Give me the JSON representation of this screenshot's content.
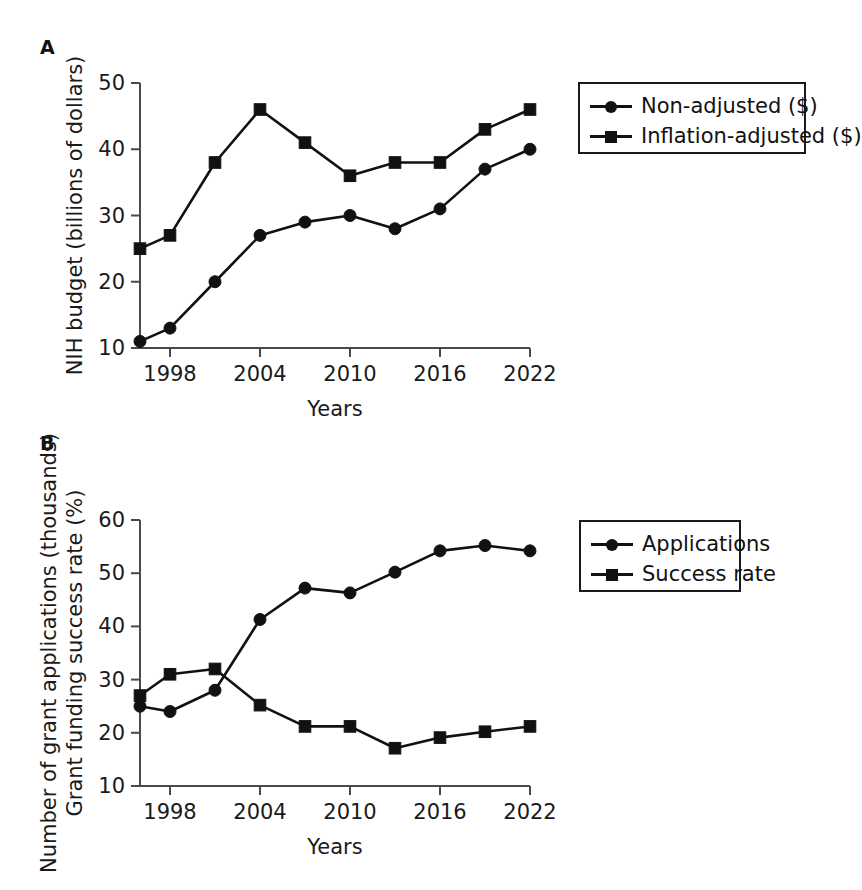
{
  "figure": {
    "panels": [
      {
        "id": "a",
        "label": "A",
        "legend": {
          "items": [
            {
              "marker": "circle",
              "label": "Non-adjusted ($)"
            },
            {
              "marker": "square",
              "label": "Inflation-adjusted ($)"
            }
          ]
        }
      },
      {
        "id": "b",
        "label": "B",
        "legend": {
          "items": [
            {
              "marker": "circle",
              "label": "Applications"
            },
            {
              "marker": "square",
              "label": "Success rate"
            }
          ]
        }
      }
    ]
  },
  "chart_data": [
    {
      "type": "line",
      "panel": "A",
      "title": "",
      "xlabel": "Years",
      "ylabel": "NIH budget (billions of dollars)",
      "ylabel_lines": [
        "NIH budget (billions of dollars)"
      ],
      "x": [
        1996,
        1998,
        2000,
        2002,
        2004,
        2006,
        2008,
        2010,
        2012,
        2014,
        2016,
        2018,
        2020,
        2022
      ],
      "xticks": [
        1998,
        2004,
        2010,
        2016,
        2022
      ],
      "xticklabels": [
        "1998",
        "2004",
        "2010",
        "2016",
        "2022"
      ],
      "yticks": [
        10,
        20,
        30,
        40,
        50
      ],
      "yticklabels": [
        "10",
        "20",
        "30",
        "40",
        "50"
      ],
      "xlim": [
        1996,
        2022
      ],
      "ylim": [
        10,
        50
      ],
      "grid": false,
      "legend_position": "right-outside",
      "series": [
        {
          "name": "Non-adjusted ($)",
          "marker": "circle",
          "color": "#111111",
          "values": [
            11,
            13,
            20,
            27,
            29,
            30,
            28,
            31,
            37,
            40
          ],
          "x": [
            1996,
            1998,
            2002,
            2006,
            2008,
            2010,
            2012,
            2016,
            2018,
            2022
          ],
          "points": [
            {
              "year": 1996,
              "value": 11
            },
            {
              "year": 1998,
              "value": 13
            },
            {
              "year": 2001,
              "value": 20
            },
            {
              "year": 2004,
              "value": 27
            },
            {
              "year": 2007,
              "value": 29
            },
            {
              "year": 2010,
              "value": 30
            },
            {
              "year": 2013,
              "value": 28
            },
            {
              "year": 2016,
              "value": 31
            },
            {
              "year": 2019,
              "value": 37
            },
            {
              "year": 2022,
              "value": 40
            }
          ]
        },
        {
          "name": "Inflation-adjusted ($)",
          "marker": "square",
          "color": "#111111",
          "values": [
            25,
            27,
            38,
            46,
            41,
            36,
            38,
            38,
            43,
            46
          ],
          "points": [
            {
              "year": 1996,
              "value": 25
            },
            {
              "year": 1998,
              "value": 27
            },
            {
              "year": 2001,
              "value": 38
            },
            {
              "year": 2004,
              "value": 46
            },
            {
              "year": 2007,
              "value": 41
            },
            {
              "year": 2010,
              "value": 36
            },
            {
              "year": 2013,
              "value": 38
            },
            {
              "year": 2016,
              "value": 38
            },
            {
              "year": 2019,
              "value": 43
            },
            {
              "year": 2022,
              "value": 46
            }
          ]
        }
      ]
    },
    {
      "type": "line",
      "panel": "B",
      "title": "",
      "xlabel": "Years",
      "ylabel": "Number of grant applications (thousands) Grant funding success rate (%)",
      "ylabel_lines": [
        "Number of grant applications (thousands)",
        "Grant funding success rate (%)"
      ],
      "xticks": [
        1998,
        2004,
        2010,
        2016,
        2022
      ],
      "xticklabels": [
        "1998",
        "2004",
        "2010",
        "2016",
        "2022"
      ],
      "yticks": [
        10,
        20,
        30,
        40,
        50,
        60
      ],
      "yticklabels": [
        "10",
        "20",
        "30",
        "40",
        "50",
        "60"
      ],
      "xlim": [
        1996,
        2022
      ],
      "ylim": [
        10,
        60
      ],
      "grid": false,
      "legend_position": "right-outside",
      "series": [
        {
          "name": "Applications",
          "marker": "circle",
          "color": "#111111",
          "points": [
            {
              "year": 1996,
              "value": 25
            },
            {
              "year": 1998,
              "value": 24
            },
            {
              "year": 2001,
              "value": 28
            },
            {
              "year": 2004,
              "value": 41.3
            },
            {
              "year": 2007,
              "value": 47.2
            },
            {
              "year": 2010,
              "value": 46.3
            },
            {
              "year": 2013,
              "value": 50.2
            },
            {
              "year": 2016,
              "value": 54.2
            },
            {
              "year": 2019,
              "value": 55.2
            },
            {
              "year": 2022,
              "value": 54.2
            }
          ]
        },
        {
          "name": "Success rate",
          "marker": "square",
          "color": "#111111",
          "points": [
            {
              "year": 1996,
              "value": 27
            },
            {
              "year": 1998,
              "value": 31
            },
            {
              "year": 2001,
              "value": 32
            },
            {
              "year": 2004,
              "value": 25.2
            },
            {
              "year": 2007,
              "value": 21.2
            },
            {
              "year": 2010,
              "value": 21.2
            },
            {
              "year": 2013,
              "value": 17.1
            },
            {
              "year": 2016,
              "value": 19.1
            },
            {
              "year": 2019,
              "value": 20.2
            },
            {
              "year": 2022,
              "value": 21.2
            }
          ]
        }
      ]
    }
  ]
}
